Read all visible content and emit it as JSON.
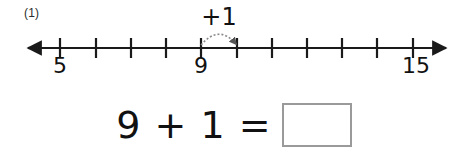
{
  "worksheet": {
    "problem_number": "(1)",
    "equation": {
      "expression": "9 + 1 =",
      "operand_left": "9",
      "operator": "+",
      "operand_right": "1",
      "equals": "=",
      "answer_value": "",
      "answer_placeholder": ""
    }
  },
  "number_line": {
    "jump_label": "+1",
    "start_value": 5,
    "end_value": 15,
    "labeled_ticks": [
      {
        "value": "5",
        "x": 60
      },
      {
        "value": "9",
        "x": 201
      },
      {
        "value": "15",
        "x": 413
      }
    ],
    "tick_positions": [
      60,
      96,
      131,
      166,
      201,
      237,
      272,
      307,
      342,
      377,
      413
    ],
    "jump_from_x": 201,
    "jump_to_x": 237,
    "axis_y": 48,
    "left_arrow_x": 28,
    "right_arrow_x": 446,
    "line_color": "#1a1a1a",
    "arc_color": "#7a7a7a",
    "box_border_color": "#9a9a9a"
  }
}
